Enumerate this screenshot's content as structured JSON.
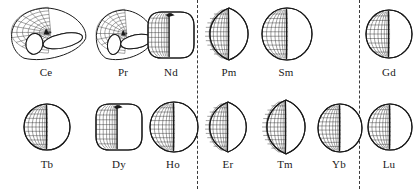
{
  "figure": {
    "title": "",
    "background_color": "#ffffff",
    "line_color": "#1a1a1a",
    "mesh_color": "#2b2b2b",
    "divider_color": "#3a3a3a",
    "width": 417,
    "height": 189,
    "dividers": [
      {
        "name": "divider-1",
        "x": 197,
        "style": "dashed"
      },
      {
        "name": "divider-2",
        "x": 359,
        "style": "dashed"
      }
    ]
  },
  "groups": [
    {
      "name": "group-left",
      "elements": [
        "Ce",
        "Pr",
        "Nd",
        "Tb",
        "Dy",
        "Ho"
      ]
    },
    {
      "name": "group-middle",
      "elements": [
        "Pm",
        "Sm",
        "Er",
        "Tm",
        "Yb"
      ]
    },
    {
      "name": "group-right",
      "elements": [
        "Gd",
        "Lu"
      ]
    }
  ],
  "rows": [
    {
      "name": "row-top",
      "cells": [
        {
          "label": "Ce",
          "shape": "torus",
          "x": 6,
          "y": 8,
          "w": 80,
          "h": 52,
          "label_x": 6,
          "label_y": 66,
          "label_w": 80,
          "mesh_cols": 12,
          "mesh_rows": 7,
          "description": "oblate torus with open hole, mesh on upper-left lobe"
        },
        {
          "label": "Pr",
          "shape": "torus",
          "x": 92,
          "y": 10,
          "w": 62,
          "h": 50,
          "label_x": 92,
          "label_y": 66,
          "label_w": 62,
          "mesh_cols": 10,
          "mesh_rows": 7,
          "description": "smaller oblate torus, mesh on left lobe"
        },
        {
          "label": "Nd",
          "shape": "rounded-oblate",
          "x": 148,
          "y": 12,
          "w": 46,
          "h": 46,
          "label_x": 148,
          "label_y": 66,
          "label_w": 46,
          "mesh_cols": 8,
          "mesh_rows": 8,
          "description": "rounded square oblate body, mesh on left third"
        },
        {
          "label": "Pm",
          "shape": "lens",
          "x": 205,
          "y": 8,
          "w": 48,
          "h": 52,
          "label_x": 203,
          "label_y": 66,
          "label_w": 52,
          "mesh_cols": 8,
          "mesh_rows": 10,
          "description": "pointed lens / prolate, dense mesh left half"
        },
        {
          "label": "Sm",
          "shape": "spheroid",
          "x": 262,
          "y": 8,
          "w": 50,
          "h": 52,
          "label_x": 260,
          "label_y": 66,
          "label_w": 52,
          "mesh_cols": 8,
          "mesh_rows": 10,
          "description": "near-spherical, mesh on left half"
        },
        {
          "label": "Gd",
          "shape": "spheroid",
          "x": 366,
          "y": 10,
          "w": 46,
          "h": 48,
          "label_x": 364,
          "label_y": 66,
          "label_w": 50,
          "mesh_cols": 8,
          "mesh_rows": 9,
          "description": "near-spherical, mesh on left half"
        }
      ]
    },
    {
      "name": "row-bottom",
      "cells": [
        {
          "label": "Tb",
          "shape": "spheroid",
          "x": 24,
          "y": 104,
          "w": 46,
          "h": 46,
          "label_x": 22,
          "label_y": 158,
          "label_w": 50,
          "mesh_cols": 8,
          "mesh_rows": 9,
          "description": "near-spherical, mesh on left half"
        },
        {
          "label": "Dy",
          "shape": "rounded-oblate",
          "x": 96,
          "y": 104,
          "w": 46,
          "h": 46,
          "label_x": 94,
          "label_y": 158,
          "label_w": 50,
          "mesh_cols": 8,
          "mesh_rows": 8,
          "description": "rounded square oblate body, mesh on left third"
        },
        {
          "label": "Ho",
          "shape": "spheroid",
          "x": 150,
          "y": 102,
          "w": 48,
          "h": 50,
          "label_x": 148,
          "label_y": 158,
          "label_w": 50,
          "mesh_cols": 8,
          "mesh_rows": 10,
          "description": "near-spherical, mesh on left half"
        },
        {
          "label": "Er",
          "shape": "lens",
          "x": 205,
          "y": 102,
          "w": 46,
          "h": 50,
          "label_x": 203,
          "label_y": 158,
          "label_w": 50,
          "mesh_cols": 8,
          "mesh_rows": 10,
          "description": "pointed lens / prolate, dense mesh left half"
        },
        {
          "label": "Tm",
          "shape": "lens",
          "x": 262,
          "y": 100,
          "w": 48,
          "h": 54,
          "label_x": 260,
          "label_y": 158,
          "label_w": 50,
          "mesh_cols": 8,
          "mesh_rows": 11,
          "description": "pointed lens / prolate, dense mesh left half"
        },
        {
          "label": "Yb",
          "shape": "spheroid",
          "x": 318,
          "y": 104,
          "w": 44,
          "h": 48,
          "label_x": 314,
          "label_y": 158,
          "label_w": 50,
          "mesh_cols": 8,
          "mesh_rows": 10,
          "description": "near-spherical, mesh on left half"
        },
        {
          "label": "Lu",
          "shape": "spheroid",
          "x": 368,
          "y": 104,
          "w": 44,
          "h": 46,
          "label_x": 364,
          "label_y": 158,
          "label_w": 50,
          "mesh_cols": 8,
          "mesh_rows": 9,
          "description": "near-spherical, mesh on left half"
        }
      ]
    }
  ]
}
